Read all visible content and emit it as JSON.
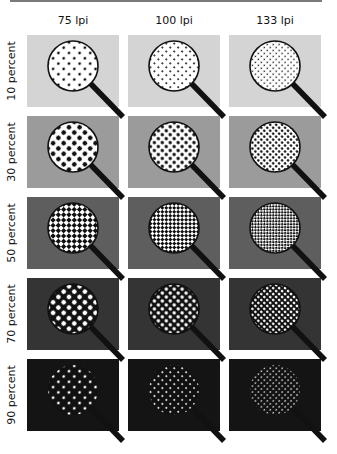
{
  "figure": {
    "columns": [
      {
        "label": "75 lpi",
        "dot_pitch": 7.5,
        "dot_scale": 1.0
      },
      {
        "label": "100 lpi",
        "dot_pitch": 5.6,
        "dot_scale": 1.0
      },
      {
        "label": "133 lpi",
        "dot_pitch": 4.2,
        "dot_scale": 1.0
      }
    ],
    "rows": [
      {
        "label": "10 percent",
        "tint": 0.1,
        "background": "#d4d4d4"
      },
      {
        "label": "30 percent",
        "tint": 0.3,
        "background": "#9b9b9b"
      },
      {
        "label": "50 percent",
        "tint": 0.5,
        "background": "#5e5e5e"
      },
      {
        "label": "70 percent",
        "tint": 0.7,
        "background": "#343434"
      },
      {
        "label": "90 percent",
        "tint": 0.9,
        "background": "#141414"
      }
    ],
    "colors": {
      "ink": "#111111",
      "paper": "#ffffff",
      "rule": "#7a7a7a"
    },
    "layout": {
      "panel_x": [
        27,
        128,
        229
      ],
      "panel_y": [
        35,
        116,
        197,
        278,
        359
      ],
      "panel_w": 92,
      "panel_h": 72
    }
  }
}
